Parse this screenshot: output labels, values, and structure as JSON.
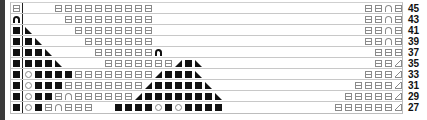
{
  "chart": {
    "type": "knitting-chart",
    "legend_symbols": {
      "box": "knit stitch (⊟)",
      "fill": "filled square (■)",
      "arch": "open arch (∩)",
      "arch-b": "bold arch (∩)",
      "circ": "yarn over (○)",
      "tl": "left-leaning decrease (◣)",
      "tr": "right-leaning decrease (◢)",
      "tro": "outlined triangle (◿)"
    },
    "rows": [
      {
        "label": "45",
        "first": "box",
        "cells": [
          [
            3,
            "box"
          ],
          [
            4,
            "box"
          ],
          [
            5,
            "box"
          ],
          [
            6,
            "box"
          ],
          [
            7,
            "box"
          ],
          [
            8,
            "box"
          ],
          [
            9,
            "box"
          ],
          [
            10,
            "box"
          ],
          [
            11,
            "box"
          ],
          [
            12,
            "box"
          ],
          [
            34,
            "box"
          ],
          [
            35,
            "box"
          ],
          [
            36,
            "arch"
          ],
          [
            37,
            "box"
          ]
        ]
      },
      {
        "label": "43",
        "first": "arch-b",
        "cells": [
          [
            4,
            "box"
          ],
          [
            5,
            "box"
          ],
          [
            6,
            "box"
          ],
          [
            7,
            "box"
          ],
          [
            8,
            "box"
          ],
          [
            9,
            "box"
          ],
          [
            10,
            "box"
          ],
          [
            11,
            "box"
          ],
          [
            12,
            "box"
          ],
          [
            34,
            "box"
          ],
          [
            35,
            "box"
          ],
          [
            36,
            "arch"
          ],
          [
            37,
            "box"
          ]
        ]
      },
      {
        "label": "41",
        "first": "fill",
        "cells": [
          [
            0,
            "tl"
          ],
          [
            5,
            "box"
          ],
          [
            6,
            "box"
          ],
          [
            7,
            "box"
          ],
          [
            8,
            "box"
          ],
          [
            9,
            "box"
          ],
          [
            10,
            "box"
          ],
          [
            11,
            "box"
          ],
          [
            12,
            "box"
          ],
          [
            34,
            "box"
          ],
          [
            35,
            "box"
          ],
          [
            36,
            "arch"
          ],
          [
            37,
            "box"
          ]
        ]
      },
      {
        "label": "39",
        "first": "fill",
        "cells": [
          [
            0,
            "fill"
          ],
          [
            1,
            "tl"
          ],
          [
            6,
            "box"
          ],
          [
            7,
            "box"
          ],
          [
            8,
            "box"
          ],
          [
            9,
            "box"
          ],
          [
            10,
            "box"
          ],
          [
            11,
            "box"
          ],
          [
            12,
            "box"
          ],
          [
            34,
            "box"
          ],
          [
            35,
            "box"
          ],
          [
            36,
            "arch"
          ],
          [
            37,
            "box"
          ]
        ]
      },
      {
        "label": "37",
        "first": "fill",
        "cells": [
          [
            0,
            "fill"
          ],
          [
            1,
            "fill"
          ],
          [
            2,
            "tl"
          ],
          [
            7,
            "box"
          ],
          [
            8,
            "box"
          ],
          [
            9,
            "box"
          ],
          [
            10,
            "box"
          ],
          [
            11,
            "box"
          ],
          [
            12,
            "box"
          ],
          [
            13,
            "arch-b"
          ],
          [
            35,
            "box"
          ],
          [
            36,
            "box"
          ],
          [
            37,
            "box"
          ]
        ]
      },
      {
        "label": "35",
        "first": "fill",
        "cells": [
          [
            0,
            "fill"
          ],
          [
            1,
            "fill"
          ],
          [
            2,
            "fill"
          ],
          [
            3,
            "tl"
          ],
          [
            8,
            "box"
          ],
          [
            9,
            "box"
          ],
          [
            10,
            "box"
          ],
          [
            11,
            "box"
          ],
          [
            12,
            "box"
          ],
          [
            13,
            "box"
          ],
          [
            14,
            "box"
          ],
          [
            15,
            "tr"
          ],
          [
            16,
            "fill"
          ],
          [
            17,
            "tl"
          ],
          [
            35,
            "box"
          ],
          [
            36,
            "box"
          ],
          [
            37,
            "tro"
          ]
        ]
      },
      {
        "label": "33",
        "first": "fill",
        "cells": [
          [
            0,
            "circ"
          ],
          [
            1,
            "fill"
          ],
          [
            2,
            "fill"
          ],
          [
            3,
            "fill"
          ],
          [
            4,
            "fill"
          ],
          [
            5,
            "box"
          ],
          [
            6,
            "box"
          ],
          [
            7,
            "box"
          ],
          [
            8,
            "box"
          ],
          [
            9,
            "box"
          ],
          [
            10,
            "box"
          ],
          [
            11,
            "box"
          ],
          [
            12,
            "box"
          ],
          [
            13,
            "tr"
          ],
          [
            14,
            "fill"
          ],
          [
            15,
            "fill"
          ],
          [
            16,
            "fill"
          ],
          [
            17,
            "tl"
          ],
          [
            34,
            "box"
          ],
          [
            35,
            "box"
          ],
          [
            36,
            "box"
          ],
          [
            37,
            "tro"
          ]
        ]
      },
      {
        "label": "31",
        "first": "fill",
        "cells": [
          [
            0,
            "circ"
          ],
          [
            1,
            "fill"
          ],
          [
            2,
            "fill"
          ],
          [
            3,
            "fill"
          ],
          [
            4,
            "box"
          ],
          [
            5,
            "box"
          ],
          [
            6,
            "box"
          ],
          [
            7,
            "box"
          ],
          [
            8,
            "box"
          ],
          [
            9,
            "box"
          ],
          [
            10,
            "box"
          ],
          [
            11,
            "box"
          ],
          [
            12,
            "tr"
          ],
          [
            13,
            "fill"
          ],
          [
            14,
            "fill"
          ],
          [
            15,
            "fill"
          ],
          [
            16,
            "fill"
          ],
          [
            17,
            "fill"
          ],
          [
            18,
            "tl"
          ],
          [
            33,
            "box"
          ],
          [
            34,
            "box"
          ],
          [
            35,
            "box"
          ],
          [
            36,
            "box"
          ],
          [
            37,
            "tro"
          ]
        ]
      },
      {
        "label": "29",
        "first": "fill",
        "cells": [
          [
            0,
            "circ"
          ],
          [
            1,
            "fill"
          ],
          [
            2,
            "fill"
          ],
          [
            3,
            "box"
          ],
          [
            4,
            "arch"
          ],
          [
            5,
            "box"
          ],
          [
            6,
            "box"
          ],
          [
            7,
            "box"
          ],
          [
            8,
            "box"
          ],
          [
            9,
            "box"
          ],
          [
            10,
            "box"
          ],
          [
            11,
            "tr"
          ],
          [
            12,
            "fill"
          ],
          [
            13,
            "fill"
          ],
          [
            14,
            "fill"
          ],
          [
            15,
            "fill"
          ],
          [
            16,
            "fill"
          ],
          [
            17,
            "fill"
          ],
          [
            18,
            "fill"
          ],
          [
            19,
            "tl"
          ],
          [
            32,
            "box"
          ],
          [
            33,
            "box"
          ],
          [
            34,
            "box"
          ],
          [
            35,
            "box"
          ],
          [
            36,
            "box"
          ],
          [
            37,
            "tro"
          ]
        ]
      },
      {
        "label": "27",
        "first": "fill",
        "cells": [
          [
            0,
            "circ"
          ],
          [
            1,
            "fill"
          ],
          [
            2,
            "box"
          ],
          [
            3,
            "arch"
          ],
          [
            4,
            "box"
          ],
          [
            5,
            "box"
          ],
          [
            6,
            "box"
          ],
          [
            9,
            "fill"
          ],
          [
            10,
            "fill"
          ],
          [
            11,
            "fill"
          ],
          [
            12,
            "fill"
          ],
          [
            13,
            "circ"
          ],
          [
            14,
            "fill"
          ],
          [
            15,
            "circ"
          ],
          [
            16,
            "fill"
          ],
          [
            17,
            "fill"
          ],
          [
            18,
            "fill"
          ],
          [
            19,
            "fill"
          ],
          [
            31,
            "box"
          ],
          [
            32,
            "box"
          ],
          [
            33,
            "box"
          ],
          [
            34,
            "box"
          ],
          [
            35,
            "box"
          ],
          [
            36,
            "box"
          ],
          [
            37,
            "tro"
          ]
        ]
      }
    ]
  }
}
